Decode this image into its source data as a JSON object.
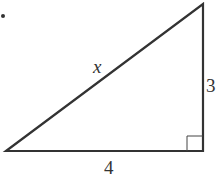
{
  "diagram": {
    "type": "right-triangle",
    "bullet": "•",
    "labels": {
      "hypotenuse": "x",
      "vertical_leg": "3",
      "horizontal_leg": "4"
    },
    "right_angle_marker": true,
    "colors": {
      "stroke": "#333333",
      "background": "#ffffff"
    }
  }
}
